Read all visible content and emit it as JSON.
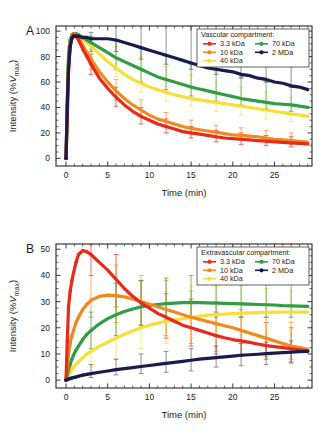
{
  "figure": {
    "panels": [
      {
        "letter": "A",
        "legend_title": "Vascular compartment:",
        "xlabel": "Time (min)",
        "ylabel_main": "Intensity (%",
        "ylabel_italic": "V",
        "ylabel_sub": "max",
        "ylabel_close": ")"
      },
      {
        "letter": "B",
        "legend_title": "Extravascular compartment:",
        "xlabel": "Time (min)",
        "ylabel_main": "Intensity (%",
        "ylabel_italic": "V",
        "ylabel_sub": "max",
        "ylabel_close": ")"
      }
    ],
    "legend_entries": [
      {
        "label": "3.3 kDa",
        "color": "#e8291c",
        "column": 0
      },
      {
        "label": "10 kDa",
        "color": "#f08a1e",
        "column": 0
      },
      {
        "label": "40 kDa",
        "color": "#f5e03a",
        "column": 0
      },
      {
        "label": "70 kDa",
        "color": "#2f9e44",
        "column": 1
      },
      {
        "label": "2 MDa",
        "color": "#171c4a",
        "column": 1
      }
    ]
  },
  "chart_data": [
    {
      "type": "line",
      "panel": "A",
      "title": "Vascular compartment",
      "xlabel": "Time (min)",
      "ylabel": "Intensity (%Vmax)",
      "xlim": [
        -1.2,
        29.5
      ],
      "ylim": [
        -6,
        104
      ],
      "xticks": [
        0,
        5,
        10,
        15,
        20,
        25
      ],
      "yticks": [
        0,
        20,
        40,
        60,
        80,
        100
      ],
      "xminor_step": 1,
      "yminor_step": 5,
      "grid": false,
      "legend_position": "top-right",
      "x": [
        0,
        0.15,
        0.3,
        0.5,
        0.7,
        0.9,
        1.2,
        1.5,
        2,
        2.5,
        3,
        4,
        5,
        6,
        7,
        8,
        9,
        10,
        11,
        12,
        13,
        14,
        15,
        16,
        17,
        18,
        19,
        20,
        21,
        22,
        23,
        24,
        25,
        26,
        27,
        28,
        29
      ],
      "series": [
        {
          "name": "3.3 kDa",
          "color": "#e8291c",
          "values": [
            0,
            30,
            68,
            88,
            95,
            97,
            96,
            93,
            86,
            80,
            74,
            63,
            55,
            48,
            42,
            37,
            33,
            30,
            27,
            25,
            23,
            21,
            20,
            19,
            18,
            17,
            16,
            15.5,
            15,
            14.5,
            14,
            13.5,
            13,
            12.5,
            12.2,
            11.8,
            11.4
          ],
          "errors": [
            {
              "x": 3,
              "lo": 66,
              "hi": 82
            },
            {
              "x": 6,
              "lo": 41,
              "hi": 56
            },
            {
              "x": 9,
              "lo": 27,
              "hi": 40
            },
            {
              "x": 12,
              "lo": 20,
              "hi": 31
            },
            {
              "x": 15,
              "lo": 16,
              "hi": 25
            },
            {
              "x": 18,
              "lo": 13,
              "hi": 22
            },
            {
              "x": 21,
              "lo": 11,
              "hi": 20
            },
            {
              "x": 24,
              "lo": 10,
              "hi": 18
            },
            {
              "x": 27,
              "lo": 9,
              "hi": 17
            }
          ]
        },
        {
          "name": "10 kDa",
          "color": "#f08a1e",
          "values": [
            0,
            35,
            72,
            90,
            96,
            98,
            97,
            95,
            89,
            83,
            78,
            68,
            60,
            53,
            47,
            42,
            38,
            34,
            31,
            29,
            27,
            25,
            23.5,
            22.5,
            21.5,
            20.5,
            19.5,
            18.5,
            18,
            17.5,
            17,
            16,
            15,
            14.5,
            14,
            13.4,
            12.8
          ],
          "errors": [
            {
              "x": 3,
              "lo": 70,
              "hi": 86
            },
            {
              "x": 6,
              "lo": 46,
              "hi": 62
            },
            {
              "x": 9,
              "lo": 32,
              "hi": 46
            },
            {
              "x": 12,
              "lo": 24,
              "hi": 36
            },
            {
              "x": 15,
              "lo": 19,
              "hi": 30
            },
            {
              "x": 18,
              "lo": 16,
              "hi": 26
            },
            {
              "x": 21,
              "lo": 14,
              "hi": 24
            },
            {
              "x": 24,
              "lo": 12,
              "hi": 22
            },
            {
              "x": 27,
              "lo": 11,
              "hi": 20
            }
          ]
        },
        {
          "name": "40 kDa",
          "color": "#f5e03a",
          "values": [
            0,
            40,
            78,
            92,
            97,
            98,
            98,
            97,
            94,
            91,
            88,
            82,
            76,
            71,
            66,
            62,
            59,
            56,
            54,
            52,
            50,
            48.5,
            47,
            46,
            45,
            44,
            43,
            42,
            41,
            40,
            39,
            38,
            37,
            36,
            35,
            34,
            33
          ],
          "errors": [
            {
              "x": 3,
              "lo": 80,
              "hi": 95
            },
            {
              "x": 6,
              "lo": 64,
              "hi": 88
            },
            {
              "x": 9,
              "lo": 52,
              "hi": 80
            },
            {
              "x": 12,
              "lo": 45,
              "hi": 72
            },
            {
              "x": 15,
              "lo": 41,
              "hi": 66
            },
            {
              "x": 18,
              "lo": 37,
              "hi": 60
            },
            {
              "x": 21,
              "lo": 34,
              "hi": 56
            },
            {
              "x": 24,
              "lo": 31,
              "hi": 52
            },
            {
              "x": 27,
              "lo": 29,
              "hi": 48
            }
          ]
        },
        {
          "name": "70 kDa",
          "color": "#2f9e44",
          "values": [
            0,
            45,
            82,
            93,
            97,
            98,
            98,
            97,
            95,
            93,
            91,
            87,
            83,
            79,
            76,
            73,
            70,
            67,
            64,
            62,
            60,
            58,
            56,
            54.5,
            53,
            51.5,
            50,
            48.5,
            47,
            46,
            45,
            44,
            43,
            42.5,
            42,
            41,
            40
          ],
          "errors": [
            {
              "x": 3,
              "lo": 84,
              "hi": 96
            },
            {
              "x": 6,
              "lo": 70,
              "hi": 92
            },
            {
              "x": 9,
              "lo": 60,
              "hi": 86
            },
            {
              "x": 12,
              "lo": 54,
              "hi": 80
            },
            {
              "x": 15,
              "lo": 49,
              "hi": 74
            },
            {
              "x": 18,
              "lo": 45,
              "hi": 69
            },
            {
              "x": 21,
              "lo": 42,
              "hi": 64
            },
            {
              "x": 24,
              "lo": 39,
              "hi": 60
            },
            {
              "x": 27,
              "lo": 37,
              "hi": 56
            }
          ]
        },
        {
          "name": "2 MDa",
          "color": "#171c4a",
          "values": [
            0,
            42,
            71,
            88,
            94,
            96,
            96,
            96,
            95,
            95,
            94,
            94,
            94,
            93,
            91,
            89,
            87,
            85,
            83,
            81,
            79,
            77,
            75,
            73,
            71,
            70,
            69,
            68,
            66,
            65,
            63,
            62,
            60,
            59,
            57,
            56,
            54
          ],
          "errors": [
            {
              "x": 3,
              "lo": 90,
              "hi": 99
            },
            {
              "x": 6,
              "lo": 84,
              "hi": 112
            },
            {
              "x": 9,
              "lo": 78,
              "hi": 112
            },
            {
              "x": 12,
              "lo": 74,
              "hi": 110
            },
            {
              "x": 15,
              "lo": 70,
              "hi": 104
            },
            {
              "x": 18,
              "lo": 66,
              "hi": 98
            },
            {
              "x": 21,
              "lo": 63,
              "hi": 94
            },
            {
              "x": 24,
              "lo": 60,
              "hi": 90
            },
            {
              "x": 27,
              "lo": 56,
              "hi": 84
            }
          ]
        }
      ]
    },
    {
      "type": "line",
      "panel": "B",
      "title": "Extravascular compartment",
      "xlabel": "Time (min)",
      "ylabel": "Intensity (%Vmax)",
      "xlim": [
        -1.2,
        29.5
      ],
      "ylim": [
        -3,
        52
      ],
      "xticks": [
        0,
        5,
        10,
        15,
        20,
        25
      ],
      "yticks": [
        0,
        10,
        20,
        30,
        40,
        50
      ],
      "xminor_step": 1,
      "yminor_step": 2.5,
      "grid": false,
      "legend_position": "top-right",
      "x": [
        0,
        0.15,
        0.3,
        0.5,
        0.7,
        0.9,
        1.2,
        1.5,
        2,
        2.5,
        3,
        4,
        5,
        6,
        7,
        8,
        9,
        10,
        11,
        12,
        13,
        14,
        15,
        16,
        17,
        18,
        19,
        20,
        21,
        22,
        23,
        24,
        25,
        26,
        27,
        28,
        29
      ],
      "series": [
        {
          "name": "3.3 kDa",
          "color": "#e8291c",
          "values": [
            0,
            15,
            28,
            34,
            38,
            41,
            45,
            48,
            49.5,
            49,
            48,
            45,
            42,
            38.5,
            35,
            32,
            29.5,
            27.5,
            25.5,
            24,
            22.5,
            21,
            20,
            19,
            18,
            17,
            16.2,
            15.5,
            15,
            14.4,
            13.8,
            13.2,
            12.8,
            12.4,
            12,
            11.6,
            11.2
          ],
          "errors": [
            {
              "x": 3,
              "lo": 40,
              "hi": 52
            },
            {
              "x": 6,
              "lo": 28,
              "hi": 48
            },
            {
              "x": 9,
              "lo": 21,
              "hi": 38
            },
            {
              "x": 12,
              "lo": 16,
              "hi": 33
            },
            {
              "x": 15,
              "lo": 13,
              "hi": 31
            },
            {
              "x": 18,
              "lo": 10,
              "hi": 26
            },
            {
              "x": 21,
              "lo": 9,
              "hi": 24
            },
            {
              "x": 24,
              "lo": 8,
              "hi": 22
            },
            {
              "x": 27,
              "lo": 7,
              "hi": 20
            }
          ]
        },
        {
          "name": "10 kDa",
          "color": "#f08a1e",
          "values": [
            0,
            5,
            10,
            14,
            17,
            19,
            22,
            24,
            27,
            29,
            30.5,
            32,
            32.5,
            32.3,
            31.8,
            31,
            30,
            29,
            28,
            27,
            26,
            25,
            24,
            23.2,
            22.4,
            21.6,
            20.8,
            20,
            19,
            18,
            17,
            16,
            15,
            14,
            13,
            12.4,
            11.8
          ],
          "errors": [
            {
              "x": 3,
              "lo": 24,
              "hi": 40
            },
            {
              "x": 6,
              "lo": 22,
              "hi": 44
            },
            {
              "x": 9,
              "lo": 20,
              "hi": 40
            },
            {
              "x": 12,
              "lo": 17,
              "hi": 38
            },
            {
              "x": 15,
              "lo": 14,
              "hi": 34
            },
            {
              "x": 18,
              "lo": 11,
              "hi": 30
            },
            {
              "x": 21,
              "lo": 10,
              "hi": 27
            },
            {
              "x": 24,
              "lo": 9,
              "hi": 24
            },
            {
              "x": 27,
              "lo": 8,
              "hi": 22
            }
          ]
        },
        {
          "name": "40 kDa",
          "color": "#f5e03a",
          "values": [
            0,
            1,
            2,
            3,
            4,
            5,
            6,
            7,
            8.5,
            10,
            11,
            13,
            14.5,
            16,
            17.5,
            18.8,
            20,
            21,
            21.8,
            22.5,
            23,
            23.5,
            24,
            24.4,
            24.8,
            25,
            25.2,
            25.4,
            25.6,
            25.7,
            25.8,
            25.9,
            26,
            26,
            26,
            26,
            26
          ],
          "errors": [
            {
              "x": 3,
              "lo": 5,
              "hi": 20
            },
            {
              "x": 6,
              "lo": 8,
              "hi": 28
            },
            {
              "x": 9,
              "lo": 12,
              "hi": 32
            },
            {
              "x": 12,
              "lo": 14,
              "hi": 34
            },
            {
              "x": 15,
              "lo": 16,
              "hi": 36
            },
            {
              "x": 18,
              "lo": 17,
              "hi": 36
            },
            {
              "x": 21,
              "lo": 18,
              "hi": 36
            },
            {
              "x": 24,
              "lo": 18,
              "hi": 35
            },
            {
              "x": 27,
              "lo": 19,
              "hi": 34
            }
          ]
        },
        {
          "name": "70 kDa",
          "color": "#2f9e44",
          "values": [
            0,
            2,
            4,
            6,
            8,
            9.5,
            11.5,
            13,
            15.5,
            17.5,
            19,
            21.5,
            23.5,
            25,
            26.2,
            27.2,
            28,
            28.5,
            28.9,
            29.2,
            29.4,
            29.6,
            29.7,
            29.6,
            29.5,
            29.4,
            29.3,
            29.2,
            29.1,
            29,
            28.9,
            28.8,
            28.7,
            28.5,
            28.4,
            28.3,
            28.2
          ],
          "errors": [
            {
              "x": 3,
              "lo": 12,
              "hi": 26
            },
            {
              "x": 6,
              "lo": 17,
              "hi": 37
            },
            {
              "x": 9,
              "lo": 21,
              "hi": 38
            },
            {
              "x": 12,
              "lo": 23,
              "hi": 39
            },
            {
              "x": 15,
              "lo": 24,
              "hi": 40
            },
            {
              "x": 18,
              "lo": 24,
              "hi": 39
            },
            {
              "x": 21,
              "lo": 24,
              "hi": 38
            },
            {
              "x": 24,
              "lo": 24,
              "hi": 38
            },
            {
              "x": 27,
              "lo": 24,
              "hi": 37
            }
          ]
        },
        {
          "name": "2 MDa",
          "color": "#171c4a",
          "values": [
            0,
            0.2,
            0.4,
            0.6,
            0.8,
            1,
            1.2,
            1.5,
            1.9,
            2.2,
            2.5,
            3,
            3.5,
            4,
            4.4,
            4.8,
            5.2,
            5.6,
            6,
            6.4,
            6.8,
            7.2,
            7.6,
            8,
            8.3,
            8.6,
            8.9,
            9.2,
            9.5,
            9.7,
            9.9,
            10.1,
            10.3,
            10.5,
            10.7,
            10.9,
            11
          ],
          "errors": [
            {
              "x": 3,
              "lo": 1,
              "hi": 6
            },
            {
              "x": 6,
              "lo": 2,
              "hi": 8
            },
            {
              "x": 9,
              "lo": 2.5,
              "hi": 10
            },
            {
              "x": 12,
              "lo": 3,
              "hi": 11
            },
            {
              "x": 15,
              "lo": 3.5,
              "hi": 12
            },
            {
              "x": 18,
              "lo": 5,
              "hi": 13
            },
            {
              "x": 21,
              "lo": 5.5,
              "hi": 14
            },
            {
              "x": 24,
              "lo": 6,
              "hi": 14.5
            },
            {
              "x": 27,
              "lo": 6.5,
              "hi": 15
            }
          ]
        }
      ]
    }
  ]
}
